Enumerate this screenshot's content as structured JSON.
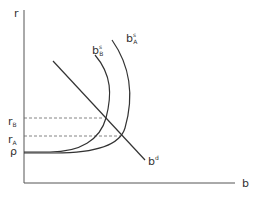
{
  "diagram": {
    "axes": {
      "y_label": "r",
      "x_label": "b"
    },
    "levels": {
      "r_B": {
        "base": "r",
        "sub": "B"
      },
      "r_A": {
        "base": "r",
        "sub": "A"
      },
      "rho": "ρ"
    },
    "curves": {
      "supply_B": {
        "base": "b",
        "sup": "s",
        "sub": "B"
      },
      "supply_A": {
        "base": "b",
        "sup": "s",
        "sub": "A"
      },
      "demand": {
        "base": "b",
        "sup": "d"
      }
    },
    "colors": {
      "line": "#333333",
      "axis": "#555555",
      "dash": "#666666"
    }
  }
}
